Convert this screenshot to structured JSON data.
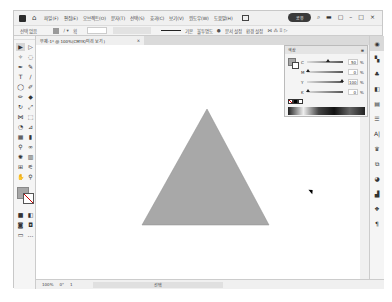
{
  "app": {
    "name": "Adobe Illustrator",
    "menu": [
      "파일(F)",
      "편집(E)",
      "오브젝트(O)",
      "문자(T)",
      "선택(S)",
      "효과(C)",
      "보기(V)",
      "윈도우(W)",
      "도움말(H)"
    ],
    "share_label": "공유"
  },
  "control_bar": {
    "selection_label": "선택 없음",
    "stroke_label": "획",
    "stroke_width": "",
    "brush_label": "기본",
    "style_label": "불투명도",
    "panel_buttons": [
      "문서 설정",
      "환경 설정"
    ]
  },
  "document_tab": {
    "title": "무제-1* @ 100%(CMYK/미리 보기)",
    "close": "×"
  },
  "status_bar": {
    "zoom": "100%",
    "rotation": "0°",
    "artboard": "1",
    "tool": "선택"
  },
  "color_panel": {
    "title": "색상",
    "sliders": [
      {
        "name": "C",
        "value": "50",
        "pct": 55
      },
      {
        "name": "M",
        "value": "0",
        "pct": 0
      },
      {
        "name": "Y",
        "value": "100",
        "pct": 100
      },
      {
        "name": "K",
        "value": "0",
        "pct": 0
      }
    ],
    "unit": "%"
  },
  "canvas": {
    "shape": "triangle",
    "fill": "#a8a8a8",
    "points": "171,64 106,180 233,180"
  },
  "colors": {
    "fill_swatch": "#a7a7a7",
    "accent": "#3a3a3a"
  }
}
